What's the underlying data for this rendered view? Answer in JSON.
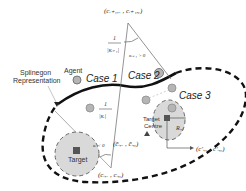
{
  "diagram": {
    "labels": {
      "splinegon_line1": "Splinegon",
      "splinegon_line2": "Representation",
      "agent": "Agent",
      "case1": "Case 1",
      "case2": "Case 2",
      "case3": "Case 3",
      "target_centre_line1": "Target",
      "target_centre_line2": "Centre",
      "target": "Target"
    },
    "math": {
      "top_vertex": "(c_{i+1,x}, c_{i+1,y})",
      "top_vertex_display": "(cᵢ₊₁,ₓ , cᵢ₊₁,ᵧ)",
      "kappa_pos": "κᵢ₊₁ > 0",
      "inv_kappa_top_num": "1",
      "inv_kappa_top_den": "|κᵢ₊₁|",
      "inv_kappa_bottom_num": "1",
      "inv_kappa_bottom_den": "|κᵢ|",
      "kappa_neg": "κᵢ < 0",
      "target_centre_coord": "(c̄ᵢ,ₓ , c̄ᵢ,ᵧ)",
      "bottom_vertex": "(cᵢ,ₓ , cᵢ,ᵧ)",
      "radius": "Rᵢ,ⱼ",
      "projected_coord": "(c′ᵢ,ₓ , c′ᵢ,ᵧ)"
    },
    "colors": {
      "curve": "#111111",
      "dashed_boundary": "#111111",
      "thin_line": "#555555",
      "target_fill": "#d9d9d9",
      "target_stroke": "#666666",
      "agent_fill": "#b5b5b5",
      "agent_stroke": "#777777",
      "square_fill": "#555555"
    }
  }
}
